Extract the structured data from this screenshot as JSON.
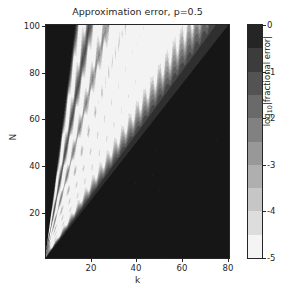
{
  "figure": {
    "title": "Approximation error, p=0.5",
    "background": "#ffffff",
    "foreground": "#262626"
  },
  "axes": {
    "xlabel": "k",
    "ylabel": "N",
    "xticks": [
      20,
      40,
      60,
      80
    ],
    "yticks": [
      20,
      40,
      60,
      80,
      100
    ],
    "xtick_labels": [
      "20",
      "40",
      "60",
      "80"
    ],
    "ytick_labels": [
      "20",
      "40",
      "60",
      "80",
      "100"
    ],
    "xlim": [
      0.5,
      80.5
    ],
    "ylim": [
      0.5,
      100.5
    ],
    "y_inverted": true,
    "grid": false
  },
  "colorbar": {
    "label": "log",
    "label_sub": "10",
    "label_rest": "|fractional error|",
    "ticks": [
      0,
      -1,
      -2,
      -3,
      -4,
      -5
    ],
    "tick_labels": [
      "0",
      "-1",
      "-2",
      "-3",
      "-4",
      "-5"
    ],
    "vmin": -5,
    "vmax": 0,
    "cmap": "gray_r",
    "orientation": "vertical",
    "levels": 10,
    "top_color": "#1a1a1a",
    "bottom_color": "#ffffff"
  },
  "chart_data": {
    "type": "heatmap",
    "title": "Approximation error, p=0.5",
    "xlabel": "k",
    "ylabel": "N",
    "zlabel": "log10|fractional error|",
    "xlim": [
      0.5,
      80.5
    ],
    "ylim": [
      0.5,
      100.5
    ],
    "zlim": [
      -5,
      0
    ],
    "cmap": "gray_r",
    "y_axis_inverted": true,
    "grid": false,
    "legend": null,
    "ridges": [
      {
        "name": "ridge-1",
        "slope_N_per_k": 6.2,
        "brightness": 0.92
      },
      {
        "name": "ridge-2",
        "slope_N_per_k": 4.3,
        "brightness": 0.95
      },
      {
        "name": "ridge-3",
        "slope_N_per_k": 3.2,
        "brightness": 0.97
      },
      {
        "name": "ridge-4",
        "slope_N_per_k": 2.55,
        "brightness": 0.99
      },
      {
        "name": "ridge-5",
        "slope_N_per_k": 2.1,
        "brightness": 0.97
      },
      {
        "name": "ridge-6",
        "slope_N_per_k": 1.78,
        "brightness": 0.9
      }
    ],
    "fan_extent_at_Nmax": {
      "N": 100,
      "k_min": 16,
      "k_max": 62
    },
    "dark_region": "k > N/1.6 (lower-right triangle) and k < N/7 (upper-left wedge)",
    "series": [
      {
        "name": "ridge-1",
        "x": [
          3,
          6,
          9,
          12,
          15
        ],
        "y": [
          19,
          37,
          56,
          74,
          93
        ],
        "values": [
          -4.6,
          -4.7,
          -4.8,
          -4.8,
          -4.9
        ]
      },
      {
        "name": "ridge-2",
        "x": [
          4,
          8,
          12,
          16,
          20,
          23
        ],
        "y": [
          17,
          34,
          52,
          69,
          86,
          99
        ],
        "values": [
          -4.7,
          -4.8,
          -4.9,
          -4.9,
          -5.0,
          -5.0
        ]
      },
      {
        "name": "ridge-3",
        "x": [
          6,
          11,
          17,
          22,
          28,
          31
        ],
        "y": [
          19,
          35,
          54,
          70,
          90,
          99
        ],
        "values": [
          -4.8,
          -4.9,
          -4.9,
          -5.0,
          -5.0,
          -5.0
        ]
      },
      {
        "name": "ridge-4",
        "x": [
          7,
          14,
          21,
          28,
          35,
          39
        ],
        "y": [
          18,
          36,
          54,
          71,
          89,
          99
        ],
        "values": [
          -4.9,
          -5.0,
          -5.0,
          -5.0,
          -5.0,
          -5.0
        ]
      },
      {
        "name": "ridge-5",
        "x": [
          9,
          17,
          26,
          34,
          43,
          47
        ],
        "y": [
          19,
          36,
          55,
          71,
          90,
          99
        ],
        "values": [
          -4.8,
          -4.9,
          -5.0,
          -5.0,
          -5.0,
          -5.0
        ]
      },
      {
        "name": "ridge-6",
        "x": [
          10,
          20,
          30,
          40,
          50,
          56
        ],
        "y": [
          18,
          36,
          53,
          71,
          89,
          100
        ],
        "values": [
          -4.5,
          -4.7,
          -4.8,
          -4.8,
          -4.9,
          -4.9
        ]
      }
    ]
  }
}
